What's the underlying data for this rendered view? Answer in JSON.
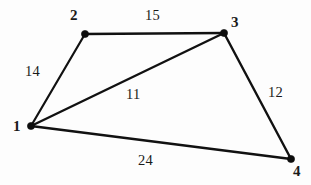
{
  "figure": {
    "background_color": "#fdfdfd",
    "line_color": "#111111",
    "text_color": "#1a1a1a",
    "width": 311,
    "height": 185
  },
  "chart_data": {
    "type": "diagram",
    "title": "",
    "xlabel": "",
    "ylabel": "",
    "grid": false,
    "legend": false,
    "nodes": [
      {
        "id": "1",
        "label": "1",
        "x": 31,
        "y": 126,
        "label_x": 13,
        "label_y": 119
      },
      {
        "id": "2",
        "label": "2",
        "x": 85,
        "y": 34,
        "label_x": 70,
        "label_y": 8
      },
      {
        "id": "3",
        "label": "3",
        "x": 224,
        "y": 33,
        "label_x": 231,
        "label_y": 15
      },
      {
        "id": "4",
        "label": "4",
        "x": 291,
        "y": 159,
        "label_x": 293,
        "label_y": 164
      }
    ],
    "edges": [
      {
        "id": "edge-1-2",
        "from": "1",
        "to": "2",
        "weight": "14",
        "weight_x": 25,
        "weight_y": 64,
        "thickness": 2.2
      },
      {
        "id": "edge-2-3",
        "from": "2",
        "to": "3",
        "weight": "15",
        "weight_x": 145,
        "weight_y": 8,
        "thickness": 2.6
      },
      {
        "id": "edge-1-3",
        "from": "1",
        "to": "3",
        "weight": "11",
        "weight_x": 126,
        "weight_y": 87,
        "thickness": 2.4
      },
      {
        "id": "edge-3-4",
        "from": "3",
        "to": "4",
        "weight": "12",
        "weight_x": 268,
        "weight_y": 85,
        "thickness": 2.4
      },
      {
        "id": "edge-1-4",
        "from": "1",
        "to": "4",
        "weight": "24",
        "weight_x": 138,
        "weight_y": 153,
        "thickness": 2.4
      }
    ]
  }
}
